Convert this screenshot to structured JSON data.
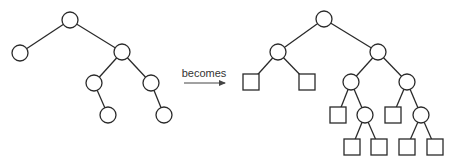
{
  "diagram": {
    "caption": "becomes",
    "colors": {
      "stroke": "#2a2a2a",
      "fill": "#ffffff",
      "text": "#333333"
    },
    "node_radius": 8,
    "square_size": 16,
    "left_tree": {
      "description": "binary tree with internal nodes only",
      "nodes": [
        {
          "id": "a",
          "type": "circle",
          "x": 70,
          "y": 20
        },
        {
          "id": "b",
          "type": "circle",
          "x": 20,
          "y": 53
        },
        {
          "id": "c",
          "type": "circle",
          "x": 122,
          "y": 52
        },
        {
          "id": "d",
          "type": "circle",
          "x": 94,
          "y": 83
        },
        {
          "id": "e",
          "type": "circle",
          "x": 151,
          "y": 83
        },
        {
          "id": "f",
          "type": "circle",
          "x": 108,
          "y": 115
        },
        {
          "id": "g",
          "type": "circle",
          "x": 164,
          "y": 115
        }
      ],
      "edges": [
        [
          "a",
          "b"
        ],
        [
          "a",
          "c"
        ],
        [
          "c",
          "d"
        ],
        [
          "c",
          "e"
        ],
        [
          "d",
          "f"
        ],
        [
          "e",
          "g"
        ]
      ]
    },
    "right_tree": {
      "description": "extended binary tree with external (square) nodes added",
      "nodes": [
        {
          "id": "A",
          "type": "circle",
          "x": 324,
          "y": 19
        },
        {
          "id": "B",
          "type": "circle",
          "x": 278,
          "y": 52
        },
        {
          "id": "C",
          "type": "circle",
          "x": 378,
          "y": 52
        },
        {
          "id": "B1",
          "type": "square",
          "x": 251,
          "y": 82
        },
        {
          "id": "B2",
          "type": "square",
          "x": 307,
          "y": 82
        },
        {
          "id": "D",
          "type": "circle",
          "x": 351,
          "y": 82
        },
        {
          "id": "E",
          "type": "circle",
          "x": 407,
          "y": 82
        },
        {
          "id": "D1",
          "type": "square",
          "x": 338,
          "y": 115
        },
        {
          "id": "F",
          "type": "circle",
          "x": 365,
          "y": 115
        },
        {
          "id": "E1",
          "type": "square",
          "x": 393,
          "y": 115
        },
        {
          "id": "G",
          "type": "circle",
          "x": 421,
          "y": 115
        },
        {
          "id": "F1",
          "type": "square",
          "x": 352,
          "y": 147
        },
        {
          "id": "F2",
          "type": "square",
          "x": 379,
          "y": 147
        },
        {
          "id": "G1",
          "type": "square",
          "x": 407,
          "y": 147
        },
        {
          "id": "G2",
          "type": "square",
          "x": 435,
          "y": 147
        }
      ],
      "edges": [
        [
          "A",
          "B"
        ],
        [
          "A",
          "C"
        ],
        [
          "B",
          "B1"
        ],
        [
          "B",
          "B2"
        ],
        [
          "C",
          "D"
        ],
        [
          "C",
          "E"
        ],
        [
          "D",
          "D1"
        ],
        [
          "D",
          "F"
        ],
        [
          "E",
          "E1"
        ],
        [
          "E",
          "G"
        ],
        [
          "F",
          "F1"
        ],
        [
          "F",
          "F2"
        ],
        [
          "G",
          "G1"
        ],
        [
          "G",
          "G2"
        ]
      ]
    },
    "arrow": {
      "x1": 184,
      "y1": 83,
      "x2": 225,
      "y2": 83
    },
    "caption_pos": {
      "x": 204,
      "y": 77
    }
  }
}
